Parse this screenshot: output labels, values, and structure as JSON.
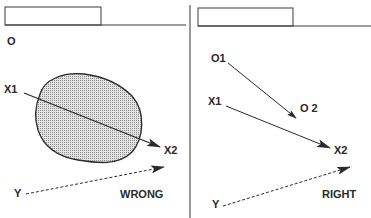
{
  "colors": {
    "ink": "#2a2a2a",
    "line": "#3a3a3a",
    "shading": "#bdbdbd",
    "background": "#ffffff"
  },
  "left_panel": {
    "observer_label": "O",
    "start_label": "X1",
    "end_label": "X2",
    "target_label": "Y",
    "verdict": "WRONG"
  },
  "right_panel": {
    "observer_start_label": "O1",
    "observer_end_label": "O 2",
    "start_label": "X1",
    "end_label": "X2",
    "target_label": "Y",
    "verdict": "RIGHT"
  }
}
